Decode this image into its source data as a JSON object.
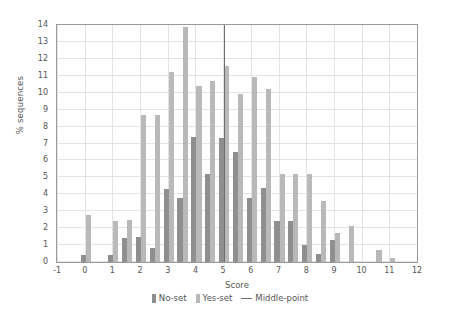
{
  "chart_data": {
    "type": "bar",
    "title": "",
    "xlabel": "Score",
    "ylabel": "% sequences",
    "xlim": [
      -1,
      12
    ],
    "ylim": [
      0,
      14
    ],
    "grid": true,
    "legend_position": "bottom",
    "xticks": [
      "-1",
      "0",
      "1",
      "2",
      "3",
      "4",
      "5",
      "6",
      "7",
      "8",
      "9",
      "10",
      "11",
      "12"
    ],
    "yticks": [
      "0",
      "1",
      "2",
      "3",
      "4",
      "5",
      "6",
      "7",
      "8",
      "9",
      "10",
      "11",
      "12",
      "13",
      "14"
    ],
    "x": [
      0,
      0.5,
      1,
      1.5,
      2,
      2.5,
      3,
      3.5,
      4,
      4.5,
      5,
      5.5,
      6,
      6.5,
      7,
      7.5,
      8,
      8.5,
      9,
      9.5,
      10,
      10.5,
      11
    ],
    "series": [
      {
        "name": "No-set",
        "color": "#8f8f8f",
        "values": [
          0.4,
          0.0,
          0.4,
          1.4,
          1.5,
          0.8,
          4.3,
          3.8,
          7.4,
          5.2,
          7.3,
          6.5,
          3.8,
          4.4,
          2.4,
          2.4,
          1.0,
          0.5,
          1.3,
          0.0,
          0.0,
          0.0,
          0.0
        ]
      },
      {
        "name": "Yes-set",
        "color": "#b9b9b9",
        "values": [
          2.8,
          0.0,
          2.4,
          2.5,
          8.7,
          8.7,
          11.2,
          13.9,
          10.4,
          10.7,
          11.6,
          9.9,
          10.9,
          10.2,
          5.2,
          5.2,
          5.2,
          3.6,
          1.7,
          2.1,
          0.0,
          0.7,
          0.25
        ]
      }
    ],
    "annotations": [
      {
        "name": "Middle-point",
        "type": "vline",
        "x": 5.0,
        "color": "#6e6e6e"
      }
    ],
    "legend": [
      {
        "label": "No-set",
        "marker": "swatch",
        "color": "#8f8f8f"
      },
      {
        "label": "Yes-set",
        "marker": "swatch",
        "color": "#b9b9b9"
      },
      {
        "label": "Middle-point",
        "marker": "line",
        "color": "#6e6e6e"
      }
    ]
  }
}
